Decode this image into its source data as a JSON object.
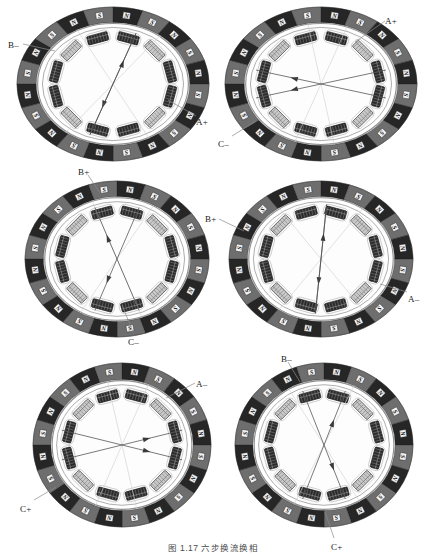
{
  "figure": {
    "caption": "图 1.17   六步换流换相",
    "panel_count": 6,
    "rows": 3,
    "cols": 2
  },
  "diagram": {
    "type": "bldc-motor-cross-section",
    "magnet_count": 20,
    "coil_slot_count": 12,
    "pole_north_label": "N",
    "pole_south_label": "S",
    "colors": {
      "magnet_dark": "#262626",
      "magnet_mid": "#6e6e6e",
      "magnet_light": "#b9b9b9",
      "pole_box_fill": "#f2f2f2",
      "pole_box_stroke": "#1a1a1a",
      "coil_dark": "#2b2b2b",
      "coil_light": "#c9c9c9",
      "stator_stroke": "#9a9a9a",
      "vector_stroke": "#4d4d4d",
      "leader_stroke": "#8a8a8a",
      "background": "#ffffff"
    }
  },
  "panels": [
    {
      "id": "panel-1",
      "step": 1,
      "labels": [
        {
          "name": "b-minus",
          "text": "B–",
          "x": 8,
          "y": 41,
          "anchor": "start",
          "leader": {
            "x1": 23,
            "y1": 44,
            "x2": 55,
            "y2": 51
          }
        },
        {
          "name": "a-plus",
          "text": "A+",
          "x": 196,
          "y": 118,
          "anchor": "start",
          "leader": {
            "x1": 196,
            "y1": 116,
            "x2": 168,
            "y2": 100
          }
        }
      ],
      "vectors": [
        {
          "name": "vector-1",
          "angle": 200,
          "arrow": true
        },
        {
          "name": "vector-2",
          "angle": 20,
          "arrow": true
        }
      ],
      "axis_lines": [
        152,
        38
      ]
    },
    {
      "id": "panel-2",
      "step": 2,
      "labels": [
        {
          "name": "a-plus",
          "text": "A+",
          "x": 385,
          "y": 17,
          "anchor": "start",
          "leader": {
            "x1": 385,
            "y1": 21,
            "x2": 355,
            "y2": 42
          }
        },
        {
          "name": "c-minus",
          "text": "C–",
          "x": 218,
          "y": 140,
          "anchor": "start",
          "leader": {
            "x1": 232,
            "y1": 136,
            "x2": 256,
            "y2": 121
          }
        }
      ],
      "vectors": [
        {
          "name": "vector-1",
          "angle": 255,
          "arrow": true
        },
        {
          "name": "vector-2",
          "angle": 285,
          "arrow": true
        }
      ],
      "axis_lines": [
        170,
        20
      ]
    },
    {
      "id": "panel-3",
      "step": 3,
      "labels": [
        {
          "name": "b-plus",
          "text": "B+",
          "x": 78,
          "y": 168,
          "anchor": "start",
          "leader": {
            "x1": 88,
            "y1": 175,
            "x2": 100,
            "y2": 193
          }
        },
        {
          "name": "c-minus",
          "text": "C–",
          "x": 128,
          "y": 338,
          "anchor": "start",
          "leader": {
            "x1": 133,
            "y1": 332,
            "x2": 122,
            "y2": 305
          }
        }
      ],
      "vectors": [
        {
          "name": "vector-1",
          "angle": 200,
          "arrow": true
        },
        {
          "name": "vector-2",
          "angle": 340,
          "arrow": true
        }
      ],
      "axis_lines": [
        160,
        30
      ]
    },
    {
      "id": "panel-4",
      "step": 4,
      "labels": [
        {
          "name": "b-plus",
          "text": "B+",
          "x": 205,
          "y": 215,
          "anchor": "start",
          "leader": {
            "x1": 219,
            "y1": 219,
            "x2": 244,
            "y2": 231
          }
        },
        {
          "name": "a-minus",
          "text": "A–",
          "x": 408,
          "y": 295,
          "anchor": "start",
          "leader": {
            "x1": 407,
            "y1": 292,
            "x2": 380,
            "y2": 284
          }
        }
      ],
      "vectors": [
        {
          "name": "vector-1",
          "angle": 185,
          "arrow": true
        },
        {
          "name": "vector-2",
          "angle": 5,
          "arrow": true
        }
      ],
      "axis_lines": [
        145,
        35
      ]
    },
    {
      "id": "panel-5",
      "step": 5,
      "labels": [
        {
          "name": "a-minus",
          "text": "A–",
          "x": 196,
          "y": 380,
          "anchor": "start",
          "leader": {
            "x1": 195,
            "y1": 383,
            "x2": 166,
            "y2": 398
          }
        },
        {
          "name": "c-plus",
          "text": "C+",
          "x": 20,
          "y": 505,
          "anchor": "start",
          "leader": {
            "x1": 34,
            "y1": 500,
            "x2": 56,
            "y2": 487
          }
        }
      ],
      "vectors": [
        {
          "name": "vector-1",
          "angle": 75,
          "arrow": true
        },
        {
          "name": "vector-2",
          "angle": 105,
          "arrow": true
        }
      ],
      "axis_lines": [
        168,
        22
      ]
    },
    {
      "id": "panel-6",
      "step": 6,
      "labels": [
        {
          "name": "b-minus",
          "text": "B–",
          "x": 281,
          "y": 355,
          "anchor": "start",
          "leader": {
            "x1": 288,
            "y1": 362,
            "x2": 300,
            "y2": 382
          }
        },
        {
          "name": "c-plus",
          "text": "C+",
          "x": 331,
          "y": 543,
          "anchor": "start",
          "leader": {
            "x1": 334,
            "y1": 538,
            "x2": 325,
            "y2": 512
          }
        }
      ],
      "vectors": [
        {
          "name": "vector-1",
          "angle": 160,
          "arrow": true
        },
        {
          "name": "vector-2",
          "angle": 20,
          "arrow": true
        }
      ],
      "axis_lines": [
        150,
        25
      ]
    }
  ]
}
